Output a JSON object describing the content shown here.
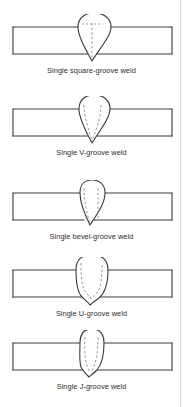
{
  "document": {
    "kind": "technical-illustration",
    "subject": "Groove weld types in cross-section",
    "background_color": "#ffffff",
    "line_color": "#3a3a3a",
    "dashed_line_color": "#8a8a8a",
    "caption_color": "#2b2b2b"
  },
  "figures": [
    {
      "id": "square-groove",
      "caption": "Single square-groove weld",
      "weld_profile": "pointed-bottom bead, straight sides",
      "groove_lines": "single vertical dashed centerline",
      "top": 14
    },
    {
      "id": "v-groove",
      "caption": "Single V-groove weld",
      "weld_profile": "pointed-bottom bead",
      "groove_lines": "two dashed lines converging to a V at the bottom",
      "top": 96
    },
    {
      "id": "bevel-groove",
      "caption": "Single bevel-groove weld",
      "weld_profile": "narrow pointed-bottom bead",
      "groove_lines": "one vertical dashed line plus one slanted dashed bevel face",
      "top": 180
    },
    {
      "id": "u-groove",
      "caption": "Single U-groove weld",
      "weld_profile": "rounded bead with small root point",
      "groove_lines": "U-shaped dashed curve",
      "top": 257
    },
    {
      "id": "j-groove",
      "caption": "Single J-groove weld",
      "weld_profile": "narrow rounded bead",
      "groove_lines": "J-shaped dashed curve with one straight side",
      "top": 330
    }
  ]
}
